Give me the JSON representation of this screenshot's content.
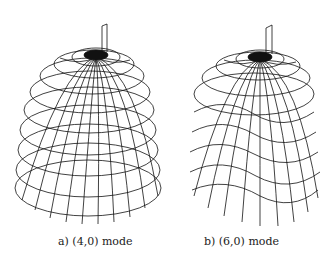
{
  "figure": {
    "panels": [
      {
        "id": "a",
        "caption": "a) (4,0) mode",
        "mode": "(4,0)",
        "label": "a)"
      },
      {
        "id": "b",
        "caption": "b) (6,0) mode",
        "mode": "(6,0)",
        "label": "b)"
      }
    ],
    "style": {
      "line_color": "#111111",
      "background": "#ffffff"
    }
  }
}
